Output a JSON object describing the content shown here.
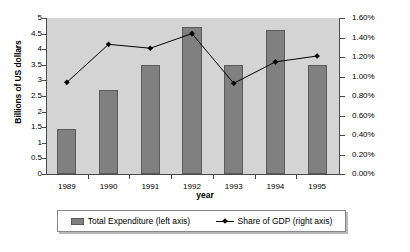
{
  "chart_data": {
    "type": "bar",
    "title": "",
    "subtitle": "",
    "xlabel": "year",
    "ylabel": "Billions of US dollars",
    "y2label": "Percent",
    "categories": [
      "1989",
      "1990",
      "1991",
      "1992",
      "1993",
      "1994",
      "1995"
    ],
    "grid": false,
    "legend_position": "bottom",
    "ylim": [
      0,
      5
    ],
    "y2lim": [
      0,
      0.016
    ],
    "y_ticks": [
      "0",
      "0.5",
      "1",
      "1.5",
      "2",
      "2.5",
      "3",
      "3.5",
      "4",
      "4.5",
      "5"
    ],
    "y_tick_values": [
      0,
      0.5,
      1,
      1.5,
      2,
      2.5,
      3,
      3.5,
      4,
      4.5,
      5
    ],
    "y2_ticks": [
      "0.00%",
      "0.20%",
      "0.40%",
      "0.60%",
      "0.80%",
      "1.00%",
      "1.20%",
      "1.40%",
      "1.60%"
    ],
    "y2_tick_values": [
      0,
      0.002,
      0.004,
      0.006,
      0.008,
      0.01,
      0.012,
      0.014,
      0.016
    ],
    "series": [
      {
        "name": "Total Expenditure (left axis)",
        "type": "bar",
        "axis": "left",
        "color": "#808080",
        "values": [
          1.45,
          2.7,
          3.5,
          4.7,
          3.5,
          4.6,
          3.5
        ]
      },
      {
        "name": "Share of GDP (right axis)",
        "type": "line",
        "axis": "right",
        "color": "#000000",
        "values": [
          0.0094,
          0.0133,
          0.0129,
          0.0144,
          0.0093,
          0.0115,
          0.0121
        ]
      }
    ]
  },
  "legend": {
    "bar_label": "Total Expenditure (left axis)",
    "line_label": "Share of GDP (right axis)"
  },
  "axes": {
    "left_title": "Billions of US dollars",
    "right_title": "Percent",
    "x_title": "year"
  }
}
